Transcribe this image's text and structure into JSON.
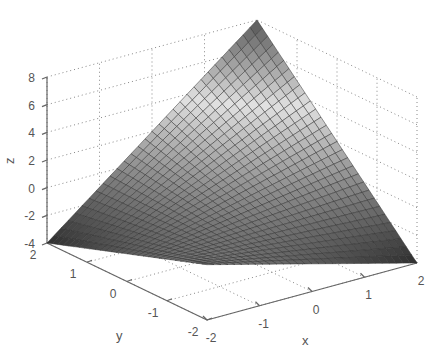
{
  "chart_data": {
    "type": "surface3d",
    "title": "",
    "function_fit": "z = x + y + x*y",
    "xlabel": "x",
    "ylabel": "y",
    "zlabel": "z",
    "xlim": [
      -2,
      2
    ],
    "ylim": [
      -2,
      2
    ],
    "zlim": [
      -4,
      8
    ],
    "x_ticks": [
      -2,
      -1,
      0,
      1,
      2
    ],
    "y_ticks": [
      -2,
      -1,
      0,
      1,
      2
    ],
    "z_ticks": [
      -4,
      -2,
      0,
      2,
      4,
      6,
      8
    ],
    "grid": true,
    "colormap": "gray",
    "mesh_resolution": 30,
    "corner_values": [
      {
        "x": -2,
        "y": 2,
        "z": -4
      },
      {
        "x": 2,
        "y": 2,
        "z": 8
      },
      {
        "x": -2,
        "y": -2,
        "z": 0
      },
      {
        "x": 2,
        "y": -2,
        "z": -4
      }
    ]
  },
  "labels": {
    "x": "x",
    "y": "y",
    "z": "z"
  },
  "colors": {
    "axis": "#666666",
    "grid": "#888888",
    "mesh_edge": "#333333",
    "text": "#555555"
  }
}
